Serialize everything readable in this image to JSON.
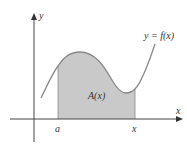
{
  "diagram": {
    "type": "area-under-curve",
    "labels": {
      "y_axis": "y",
      "x_axis": "x",
      "curve": "y = f(x)",
      "area": "A(x)",
      "left_bound": "a",
      "right_bound": "x"
    },
    "colors": {
      "axis": "#333333",
      "curve": "#8a8a8a",
      "shade": "#c8c8c8",
      "text": "#333333"
    }
  }
}
